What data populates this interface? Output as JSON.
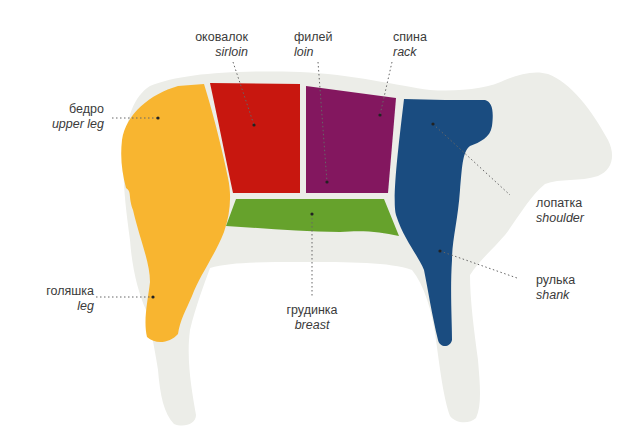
{
  "diagram": {
    "colors": {
      "silhouette": "#ecede8",
      "upper_leg": "#f8b530",
      "sirloin": "#c8170f",
      "loin": "#83175f",
      "rack": "#83175f",
      "breast": "#66a22c",
      "shoulder": "#1a4c80",
      "divider": "#f3f3ee",
      "leader": "#555555",
      "text": "#3a3a3a"
    },
    "cuts": [
      {
        "id": "sirloin",
        "ru": "оковалок",
        "en": "sirloin"
      },
      {
        "id": "loin",
        "ru": "филей",
        "en": "loin"
      },
      {
        "id": "rack",
        "ru": "спина",
        "en": "rack"
      },
      {
        "id": "upper_leg",
        "ru": "бедро",
        "en": "upper leg"
      },
      {
        "id": "shoulder",
        "ru": "лопатка",
        "en": "shoulder"
      },
      {
        "id": "shank",
        "ru": "рулька",
        "en": "shank"
      },
      {
        "id": "leg",
        "ru": "голяшка",
        "en": "leg"
      },
      {
        "id": "breast",
        "ru": "грудинка",
        "en": "breast"
      }
    ]
  }
}
